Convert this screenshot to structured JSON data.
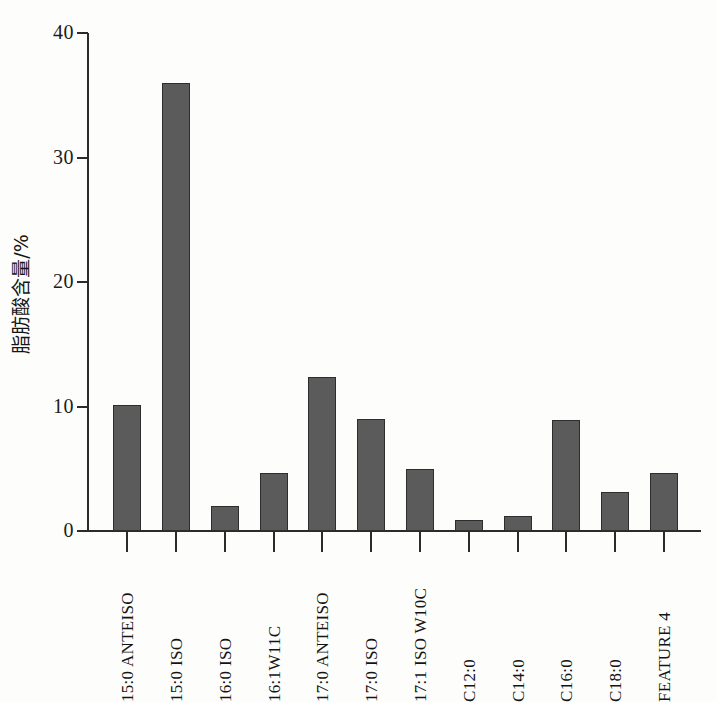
{
  "chart_data": {
    "type": "bar",
    "title": "",
    "xlabel": "",
    "ylabel": "脂肪酸含量/%",
    "ylim": [
      0,
      40
    ],
    "ytick_values": [
      0,
      10,
      20,
      30,
      40
    ],
    "ytick_labels": [
      "0",
      "10",
      "20",
      "30",
      "40"
    ],
    "grid": false,
    "legend": null,
    "bar_color": "#5b5b5b",
    "bar_edge_color": "#2e2e2e",
    "axis_color": "#2b2b2b",
    "background_color": "#fdfdfb",
    "categories": [
      "15:0 ANTEISO",
      "15:0 ISO",
      "16:0 ISO",
      "16:1W11C",
      "17:0 ANTEISO",
      "17:0 ISO",
      "17:1 ISO W10C",
      "C12:0",
      "C14:0",
      "C16:0",
      "C18:0",
      "FEATURE 4"
    ],
    "values": [
      10.1,
      36.0,
      2.0,
      4.7,
      12.4,
      9.0,
      5.0,
      0.9,
      1.2,
      8.9,
      3.1,
      4.7
    ]
  },
  "figure": {
    "y_axis_title": "脂肪酸含量/%"
  }
}
